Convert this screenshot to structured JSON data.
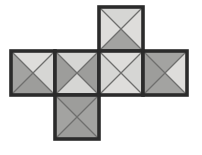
{
  "figure": {
    "type": "net-diagram",
    "shape": "cube-net",
    "caption": "",
    "background_color": "#ffffff",
    "geometry": {
      "cell_size": 44,
      "origin_x": 11,
      "origin_y": 7,
      "columns": 4,
      "rows": 3
    },
    "palette": {
      "light_gray": "#d6d6d4",
      "light_gray_alt": "#dedddb",
      "dark_gray": "#a3a3a1",
      "dark_gray_alt": "#9d9d9b",
      "outline": "#2b2b2b",
      "diagonal": "#6f6f6d",
      "background": "#ffffff"
    },
    "faces": [
      {
        "id": "face-top",
        "label": "top",
        "col": 2,
        "row": 0,
        "triangles": {
          "top": "light",
          "right": "light",
          "bottom": "dark",
          "left": "light"
        }
      },
      {
        "id": "face-left",
        "label": "left",
        "col": 0,
        "row": 1,
        "triangles": {
          "top": "light",
          "right": "light",
          "bottom": "dark",
          "left": "dark"
        }
      },
      {
        "id": "face-front",
        "label": "front",
        "col": 1,
        "row": 1,
        "triangles": {
          "top": "light",
          "right": "dark",
          "bottom": "light",
          "left": "dark"
        }
      },
      {
        "id": "face-right",
        "label": "right",
        "col": 2,
        "row": 1,
        "triangles": {
          "top": "light",
          "right": "light",
          "bottom": "light",
          "left": "light"
        }
      },
      {
        "id": "face-back",
        "label": "back",
        "col": 3,
        "row": 1,
        "triangles": {
          "top": "dark",
          "right": "light",
          "bottom": "dark",
          "left": "dark"
        }
      },
      {
        "id": "face-bottom",
        "label": "bottom",
        "col": 1,
        "row": 2,
        "triangles": {
          "top": "dark",
          "right": "dark",
          "bottom": "dark",
          "left": "dark"
        }
      }
    ]
  }
}
